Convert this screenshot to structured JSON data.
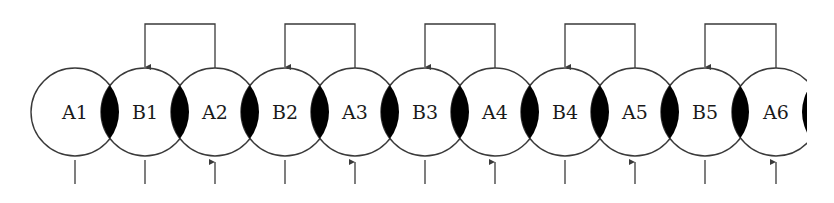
{
  "diagram": {
    "title": "",
    "nodes": [
      {
        "id": "A1",
        "label": "A1",
        "cx": 75,
        "bottom": "line"
      },
      {
        "id": "B1",
        "label": "B1",
        "cx": 145,
        "bottom": "line"
      },
      {
        "id": "A2",
        "label": "A2",
        "cx": 215,
        "bottom": "arrow-up"
      },
      {
        "id": "B2",
        "label": "B2",
        "cx": 285,
        "bottom": "line"
      },
      {
        "id": "A3",
        "label": "A3",
        "cx": 355,
        "bottom": "arrow-up"
      },
      {
        "id": "B3",
        "label": "B3",
        "cx": 425,
        "bottom": "line"
      },
      {
        "id": "A4",
        "label": "A4",
        "cx": 495,
        "bottom": "arrow-up"
      },
      {
        "id": "B4",
        "label": "B4",
        "cx": 565,
        "bottom": "line"
      },
      {
        "id": "A5",
        "label": "A5",
        "cx": 635,
        "bottom": "arrow-up"
      },
      {
        "id": "B5",
        "label": "B5",
        "cx": 705,
        "bottom": "line"
      },
      {
        "id": "A6",
        "label": "A6",
        "cx": 776,
        "bottom": "arrow-up"
      }
    ],
    "feedback_links": [
      {
        "from": "A2",
        "to": "B1"
      },
      {
        "from": "A3",
        "to": "B2"
      },
      {
        "from": "A4",
        "to": "B3"
      },
      {
        "from": "A5",
        "to": "B4"
      },
      {
        "from": "A6",
        "to": "B5"
      }
    ],
    "geometry": {
      "cy": 112,
      "r": 44,
      "bracket_top": 24,
      "tick_top": 160,
      "tick_bottom": 184,
      "clip_right": 807
    },
    "colors": {
      "stroke": "#3a3a3a",
      "overlap_fill": "#000000",
      "background": "#ffffff"
    }
  }
}
